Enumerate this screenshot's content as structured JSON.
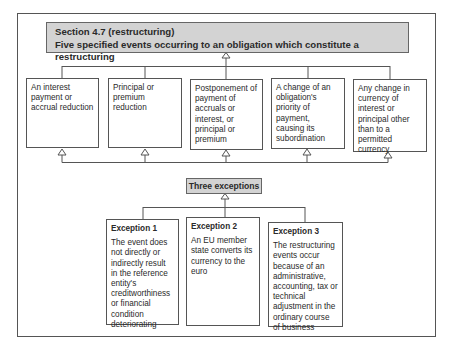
{
  "diagram": {
    "header": {
      "line1": "Section 4.7 (restructuring)",
      "line2": "Five specified events occurring to an obligation which constitute a restructuring"
    },
    "events": [
      {
        "text": "An interest payment or accrual reduction"
      },
      {
        "text": "Principal or premium reduction"
      },
      {
        "text": "Postponement of payment of accruals or interest, or principal or premium"
      },
      {
        "text": "A change of an obligation's priority of payment, causing its subordination"
      },
      {
        "text": "Any change in currency of interest or principal other than to a permitted currency"
      }
    ],
    "exceptions_label": "Three exceptions",
    "exceptions": [
      {
        "title": "Exception 1",
        "text": "The event does not directly or indirectly result in the reference entity's creditworthiness or financial condition deteriorating"
      },
      {
        "title": "Exception 2",
        "text": "An EU member state converts its currency to the euro"
      },
      {
        "title": "Exception 3",
        "text": "The restructuring events occur because of an administrative, accounting, tax or technical adjustment in the ordinary course of business"
      }
    ],
    "colors": {
      "header_fill": "#d3d3d3",
      "border": "#555555",
      "text": "#2a2a2a"
    }
  }
}
